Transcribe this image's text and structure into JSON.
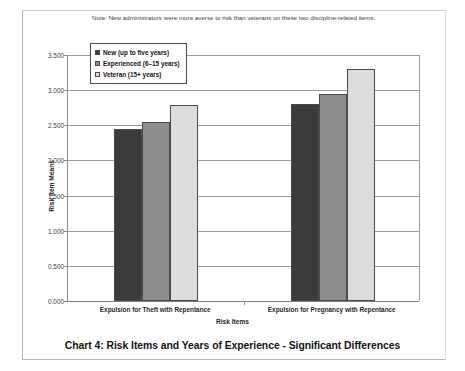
{
  "note": "Note: New administrators were more averse to risk than veterans on these two discipline-related items.",
  "caption": "Chart 4: Risk Items and Years of Experience - Significant Differences",
  "legend": {
    "items": [
      {
        "label": "New (up to five years)",
        "color": "#3b3b3b"
      },
      {
        "label": "Experienced (6–15 years)",
        "color": "#8d8d8d"
      },
      {
        "label": "Veteran (15+ years)",
        "color": "#dcdcdc"
      }
    ]
  },
  "chart_data": {
    "type": "bar",
    "title": "Chart 4: Risk Items and Years of Experience - Significant Differences",
    "subtitle": "Note: New administrators were more averse to risk than veterans on these two discipline-related items.",
    "xlabel": "Risk Items",
    "ylabel": "Risk Item Means",
    "categories": [
      "Expulsion for Theft with Repentance",
      "Expulsion for Pregnancy with Repentance"
    ],
    "series": [
      {
        "name": "New (up to five years)",
        "color": "#3b3b3b",
        "values": [
          2.45,
          2.8
        ]
      },
      {
        "name": "Experienced (6–15 years)",
        "color": "#8d8d8d",
        "values": [
          2.55,
          2.95
        ]
      },
      {
        "name": "Veteran (15+ years)",
        "color": "#dcdcdc",
        "values": [
          2.79,
          3.3
        ]
      }
    ],
    "ylim": [
      0.0,
      3.5
    ],
    "ytick_values": [
      0.0,
      0.5,
      1.0,
      1.5,
      2.0,
      2.5,
      3.0,
      3.5
    ],
    "ytick_labels": [
      "0.000",
      "0.500",
      "1.000",
      "1.500",
      "2.000",
      "2.500",
      "3.000",
      "3.500"
    ],
    "grid": true,
    "legend_position": "upper-left-inside"
  }
}
